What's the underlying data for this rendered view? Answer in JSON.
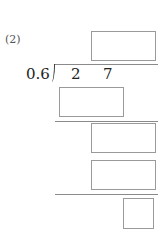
{
  "problem": {
    "number_label": "(2)",
    "divisor": "0.6",
    "dividend_digits": [
      "2",
      "7"
    ]
  },
  "answer_boxes": [
    {
      "id": "quotient",
      "value": ""
    },
    {
      "id": "product-1",
      "value": ""
    },
    {
      "id": "remainder-1",
      "value": ""
    },
    {
      "id": "product-2",
      "value": ""
    },
    {
      "id": "remainder-final",
      "value": ""
    }
  ],
  "colors": {
    "box_border": "#9a9a9a",
    "line": "#8a8a8a",
    "text": "#222222"
  }
}
